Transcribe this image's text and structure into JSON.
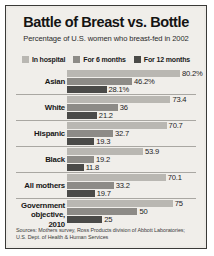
{
  "header": {
    "title": "Battle of Breast vs. Bottle",
    "subtitle": "Percentage of U.S. women who breast-fed in 2002"
  },
  "legend": {
    "items": [
      {
        "label": "In hospital",
        "color": "#b9b7b2"
      },
      {
        "label": "For 6 months",
        "color": "#8d8b87"
      },
      {
        "label": "For 12 months",
        "color": "#4a4a48"
      }
    ]
  },
  "sources": {
    "line1": "Sources: Mothers survey, Ross Products division of Abbott Laboratories;",
    "line2": "U.S. Dept. of Health & Human Services"
  },
  "chart_data": {
    "type": "bar",
    "orientation": "horizontal",
    "title": "Battle of Breast vs. Bottle",
    "subtitle": "Percentage of U.S. women who breast-fed in 2002",
    "xlabel": "",
    "ylabel": "",
    "xlim": [
      0,
      80.2
    ],
    "grid": false,
    "legend_position": "top-center",
    "categories": [
      "Asian",
      "White",
      "Hispanic",
      "Black",
      "All mothers",
      "Government objective, 2010"
    ],
    "series": [
      {
        "name": "In hospital",
        "color": "#b9b7b2",
        "values": [
          80.2,
          73.4,
          70.7,
          53.9,
          70.1,
          75
        ]
      },
      {
        "name": "For 6 months",
        "color": "#8d8b87",
        "values": [
          46.2,
          36,
          32.7,
          19.2,
          33.2,
          50
        ]
      },
      {
        "name": "For 12 months",
        "color": "#4a4a48",
        "values": [
          28.1,
          21.2,
          19.3,
          11.8,
          19.7,
          25
        ]
      }
    ],
    "groups": [
      {
        "label": "Asian",
        "label_lines": [
          "Asian"
        ],
        "bars": [
          {
            "series": "In hospital",
            "value": 80.2,
            "value_label": "80.2%",
            "color": "#b9b7b2"
          },
          {
            "series": "For 6 months",
            "value": 46.2,
            "value_label": "46.2%",
            "color": "#8d8b87"
          },
          {
            "series": "For 12 months",
            "value": 28.1,
            "value_label": "28.1%",
            "color": "#4a4a48"
          }
        ]
      },
      {
        "label": "White",
        "label_lines": [
          "White"
        ],
        "bars": [
          {
            "series": "In hospital",
            "value": 73.4,
            "value_label": "73.4",
            "color": "#b9b7b2"
          },
          {
            "series": "For 6 months",
            "value": 36,
            "value_label": "36",
            "color": "#8d8b87"
          },
          {
            "series": "For 12 months",
            "value": 21.2,
            "value_label": "21.2",
            "color": "#4a4a48"
          }
        ]
      },
      {
        "label": "Hispanic",
        "label_lines": [
          "Hispanic"
        ],
        "bars": [
          {
            "series": "In hospital",
            "value": 70.7,
            "value_label": "70.7",
            "color": "#b9b7b2"
          },
          {
            "series": "For 6 months",
            "value": 32.7,
            "value_label": "32.7",
            "color": "#8d8b87"
          },
          {
            "series": "For 12 months",
            "value": 19.3,
            "value_label": "19.3",
            "color": "#4a4a48"
          }
        ]
      },
      {
        "label": "Black",
        "label_lines": [
          "Black"
        ],
        "bars": [
          {
            "series": "In hospital",
            "value": 53.9,
            "value_label": "53.9",
            "color": "#b9b7b2"
          },
          {
            "series": "For 6 months",
            "value": 19.2,
            "value_label": "19.2",
            "color": "#8d8b87"
          },
          {
            "series": "For 12 months",
            "value": 11.8,
            "value_label": "11.8",
            "color": "#4a4a48"
          }
        ]
      },
      {
        "label": "All mothers",
        "label_lines": [
          "All mothers"
        ],
        "bars": [
          {
            "series": "In hospital",
            "value": 70.1,
            "value_label": "70.1",
            "color": "#b9b7b2"
          },
          {
            "series": "For 6 months",
            "value": 33.2,
            "value_label": "33.2",
            "color": "#8d8b87"
          },
          {
            "series": "For 12 months",
            "value": 19.7,
            "value_label": "19.7",
            "color": "#4a4a48"
          }
        ]
      },
      {
        "label": "Government objective, 2010",
        "label_lines": [
          "Government",
          "objective,",
          "2010"
        ],
        "bars": [
          {
            "series": "In hospital",
            "value": 75,
            "value_label": "75",
            "color": "#b9b7b2"
          },
          {
            "series": "For 6 months",
            "value": 50,
            "value_label": "50",
            "color": "#8d8b87"
          },
          {
            "series": "For 12 months",
            "value": 25,
            "value_label": "25",
            "color": "#4a4a48"
          }
        ]
      }
    ]
  }
}
